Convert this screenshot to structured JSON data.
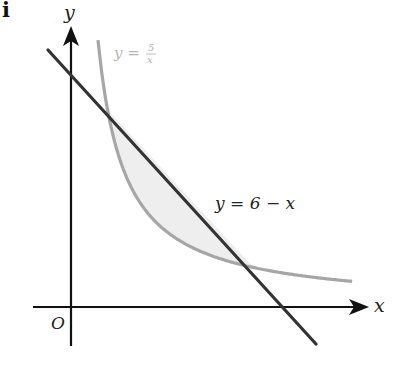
{
  "part_label": "i",
  "axes": {
    "x_label": "x",
    "y_label": "y",
    "origin_label": "O"
  },
  "curves": {
    "hyperbola": {
      "label_prefix": "y =",
      "numerator": "5",
      "denominator": "x",
      "color": "#a6a6a6"
    },
    "line": {
      "label": "y = 6 − x",
      "color": "#333333"
    }
  },
  "shaded_region": {
    "fill": "#eeeeee",
    "description": "Region between y = 5/x and y = 6 − x for 1 ≤ x ≤ 5"
  },
  "intersections": [
    {
      "x": 1,
      "y": 5
    },
    {
      "x": 5,
      "y": 1
    }
  ]
}
